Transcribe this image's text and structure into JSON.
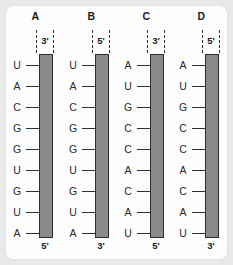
{
  "figure": {
    "background_color": "#e9e9e9",
    "card_color": "#fdfdfd",
    "strand_color": "#8a8a8a",
    "strand_border_color": "#2e2e2e",
    "text_color": "#2a2a2a"
  },
  "columns": [
    {
      "header": "A",
      "top_end_label": "3'",
      "bottom_end_label": "5'",
      "bases": [
        "U",
        "A",
        "C",
        "G",
        "G",
        "U",
        "G",
        "U",
        "A"
      ]
    },
    {
      "header": "B",
      "top_end_label": "5'",
      "bottom_end_label": "3'",
      "bases": [
        "U",
        "A",
        "C",
        "G",
        "G",
        "U",
        "G",
        "U",
        "A"
      ]
    },
    {
      "header": "C",
      "top_end_label": "3'",
      "bottom_end_label": "5'",
      "bases": [
        "A",
        "U",
        "G",
        "C",
        "C",
        "A",
        "C",
        "A",
        "U"
      ]
    },
    {
      "header": "D",
      "top_end_label": "5'",
      "bottom_end_label": "3'",
      "bases": [
        "A",
        "U",
        "G",
        "C",
        "C",
        "A",
        "C",
        "A",
        "U"
      ]
    }
  ]
}
